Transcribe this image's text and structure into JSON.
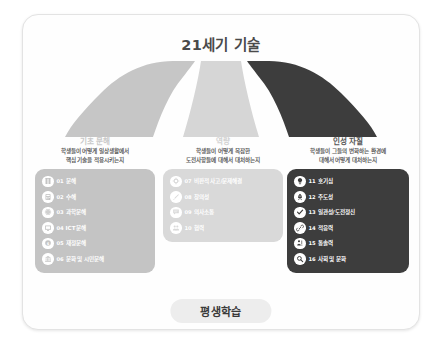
{
  "title": "21세기 기술",
  "banner": {
    "label": "평생학습"
  },
  "colors": {
    "fan_left": "#c6c6c6",
    "fan_middle": "#d6d6d6",
    "fan_right": "#3d3d3d",
    "panel_left": "#c4c4c4",
    "panel_middle": "#d9d9d9",
    "panel_right": "#3d3d3d",
    "card_bg": "#fefefe",
    "banner_bg": "#ededed"
  },
  "columns": [
    {
      "heading": "기초 문해",
      "subtitle_line1": "학생들이 어떻게 일상생활에서",
      "subtitle_line2": "핵심 기술을 적용시키는지",
      "items": [
        {
          "num": "01",
          "label": "문해",
          "icon": "book-icon"
        },
        {
          "num": "02",
          "label": "수해",
          "icon": "calculator-icon"
        },
        {
          "num": "03",
          "label": "과학문해",
          "icon": "atom-icon"
        },
        {
          "num": "04",
          "label": "ICT문해",
          "icon": "monitor-icon"
        },
        {
          "num": "05",
          "label": "재정문해",
          "icon": "coin-icon"
        },
        {
          "num": "06",
          "label": "문화 및 시민문해",
          "icon": "building-icon"
        }
      ]
    },
    {
      "heading": "역량",
      "subtitle_line1": "학생들이 어떻게 복잡한",
      "subtitle_line2": "도전사항들에 대해서 대처하는지",
      "items": [
        {
          "num": "07",
          "label": "비판적 사고/문제해결",
          "icon": "gear-icon"
        },
        {
          "num": "08",
          "label": "창의성",
          "icon": "brush-icon"
        },
        {
          "num": "09",
          "label": "의사소통",
          "icon": "chat-icon"
        },
        {
          "num": "10",
          "label": "협력",
          "icon": "people-icon"
        }
      ]
    },
    {
      "heading": "인성 자질",
      "subtitle_line1": "학생들이 그들의 변화하는 환경에",
      "subtitle_line2": "대해서 어떻게 대처하는지",
      "items": [
        {
          "num": "11",
          "label": "호기심",
          "icon": "bulb-icon"
        },
        {
          "num": "12",
          "label": "주도성",
          "icon": "rocket-icon"
        },
        {
          "num": "13",
          "label": "일관성/도전정신",
          "icon": "check-icon"
        },
        {
          "num": "14",
          "label": "적응력",
          "icon": "link-icon"
        },
        {
          "num": "15",
          "label": "통솔력",
          "icon": "leader-icon"
        },
        {
          "num": "16",
          "label": "사회 및 문화",
          "icon": "magnifier-icon"
        }
      ]
    }
  ]
}
